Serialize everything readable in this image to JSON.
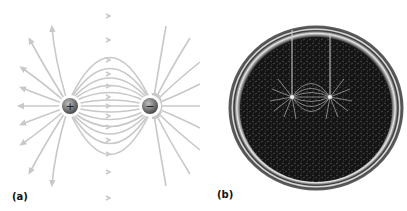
{
  "figure": {
    "panel_a": {
      "label": "(a)",
      "description": "Electric field lines of an electric dipole",
      "positive_charge": {
        "symbol": "+",
        "x": 70,
        "y": 106
      },
      "negative_charge": {
        "symbol": "−",
        "x": 150,
        "y": 106
      },
      "line_color": "#c8c8c8",
      "charge_color": "#777777"
    },
    "panel_b": {
      "label": "(b)",
      "description": "Photograph of field lines traced by seeds in oil around two charged electrodes",
      "dish_color": "#111111"
    }
  }
}
